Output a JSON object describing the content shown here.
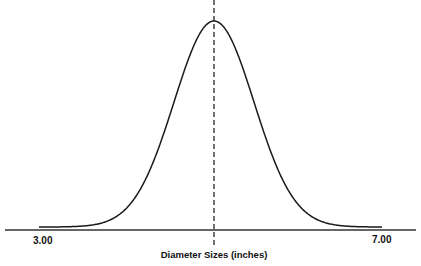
{
  "chart_data": {
    "type": "line",
    "title": "",
    "subtitle": "",
    "xlabel": "Diameter Sizes (inches)",
    "ylabel": "",
    "x_tick_labels": [
      "3.00",
      "7.00"
    ],
    "xlim": [
      3.0,
      7.0
    ],
    "distribution": {
      "kind": "normal",
      "mean_estimated": 5.0,
      "std_dev_estimated": 0.47
    },
    "mean_marker": {
      "x": 5.0,
      "style": "dashed",
      "color": "#111111"
    },
    "grid": false,
    "legend": null,
    "x": [
      3.0,
      3.5,
      4.0,
      4.25,
      4.5,
      4.75,
      5.0,
      5.25,
      5.5,
      5.75,
      6.0,
      6.5,
      7.0
    ],
    "values": [
      0.0001,
      0.0025,
      0.0329,
      0.0909,
      0.2262,
      0.4223,
      1.0,
      0.4223,
      0.2262,
      0.0909,
      0.0329,
      0.0025,
      0.0001
    ],
    "values_note": "relative density (peak = 1.0), estimated from curve shape"
  },
  "axis": {
    "left_label": "3.00",
    "right_label": "7.00",
    "title": "Diameter Sizes (inches)"
  },
  "colors": {
    "line": "#1a1a1a",
    "axis": "#333333",
    "background": "#ffffff"
  },
  "geometry": {
    "axis_y": 230,
    "axis_x0": 5,
    "axis_x1": 416,
    "curve_x0": 39,
    "curve_x1": 382,
    "peak_x": 214,
    "peak_y": 21,
    "base_y": 227,
    "sigma_px": 40,
    "dash_y0": 0,
    "dash_y1": 246
  }
}
